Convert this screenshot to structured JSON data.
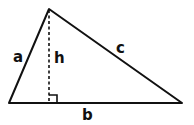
{
  "diagram": {
    "type": "triangle-with-height",
    "colors": {
      "stroke": "#111111",
      "background": "#ffffff"
    },
    "vertices": {
      "apex": [
        49,
        9
      ],
      "left": [
        9,
        103
      ],
      "right": [
        182,
        103
      ]
    },
    "height_foot": [
      49,
      103
    ],
    "labels": {
      "a": "a",
      "b": "b",
      "c": "c",
      "h": "h"
    }
  }
}
